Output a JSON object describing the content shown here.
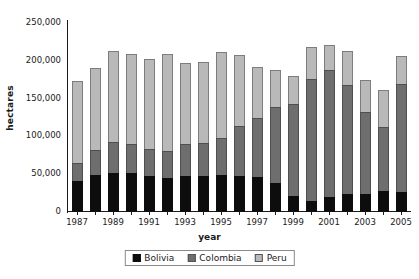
{
  "chart_data": {
    "type": "bar",
    "stacked": true,
    "title": "",
    "xlabel": "year",
    "ylabel": "hectares",
    "ylim": [
      0,
      250000
    ],
    "ytick_values": [
      0,
      50000,
      100000,
      150000,
      200000,
      250000
    ],
    "ytick_labels": [
      "0",
      "50,000",
      "100,000",
      "150,000",
      "200,000",
      "250,000"
    ],
    "grid": false,
    "legend_position": "bottom-center",
    "categories": [
      "1987",
      "1988",
      "1989",
      "1990",
      "1991",
      "1992",
      "1993",
      "1994",
      "1995",
      "1996",
      "1997",
      "1998",
      "1999",
      "2000",
      "2001",
      "2002",
      "2003",
      "2004",
      "2005"
    ],
    "xtick_labels_shown": [
      "1987",
      "1989",
      "1991",
      "1993",
      "1995",
      "1997",
      "1999",
      "2001",
      "2003",
      "2005"
    ],
    "series": [
      {
        "name": "Bolivia",
        "color": "#0d0d0d",
        "values": [
          41000,
          49000,
          52000,
          51000,
          47000,
          45000,
          47000,
          48000,
          48600,
          48100,
          45800,
          38000,
          21800,
          14600,
          19900,
          24400,
          23600,
          27700,
          26500
        ]
      },
      {
        "name": "Colombia",
        "color": "#6e6e6e",
        "values": [
          25000,
          33800,
          42400,
          40100,
          37500,
          37100,
          44700,
          44900,
          50900,
          67200,
          79400,
          102000,
          122500,
          163300,
          169800,
          144400,
          110000,
          86000,
          144000
        ]
      },
      {
        "name": "Peru",
        "color": "#b9b9b9",
        "values": [
          109600,
          110500,
          120600,
          120400,
          120500,
          129200,
          108400,
          108200,
          115300,
          94400,
          68800,
          51000,
          38700,
          43400,
          34200,
          46700,
          44200,
          50300,
          38000
        ]
      }
    ],
    "totals": [
      175600,
      193300,
      215000,
      211500,
      205000,
      211300,
      200100,
      201100,
      214800,
      209700,
      194000,
      191000,
      183000,
      221300,
      223900,
      215500,
      177800,
      164000,
      208500
    ]
  },
  "legend": {
    "items": [
      {
        "label": "Bolivia",
        "swatch": "bolivia"
      },
      {
        "label": "Colombia",
        "swatch": "colombia"
      },
      {
        "label": "Peru",
        "swatch": "peru"
      }
    ]
  }
}
